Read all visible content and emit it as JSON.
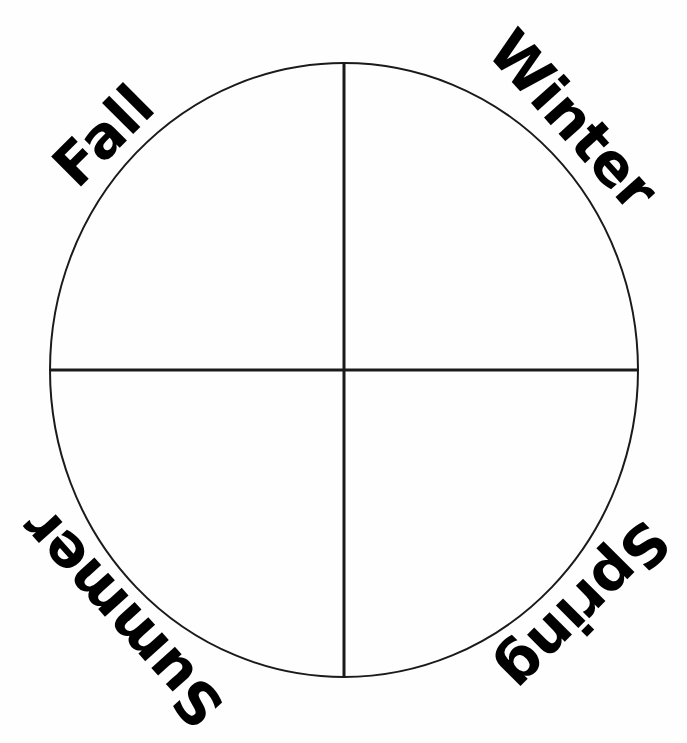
{
  "diagram": {
    "type": "seasons-wheel",
    "background_color": "#fefefe",
    "line_color": "#1a1a1a",
    "text_color": "#000000",
    "circle": {
      "center_x": 344,
      "center_y": 370,
      "radius_x": 294,
      "radius_y": 307,
      "stroke_width": 2
    },
    "dividers": [
      {
        "name": "vertical-diameter",
        "orientation": "vertical",
        "stroke_width": 3
      },
      {
        "name": "horizontal-diameter",
        "orientation": "horizontal",
        "stroke_width": 3
      }
    ],
    "labels": [
      {
        "id": "fall",
        "text": "Fall",
        "quadrant": "upper-left",
        "rotation_deg": -45
      },
      {
        "id": "winter",
        "text": "Winter",
        "quadrant": "upper-right",
        "rotation_deg": 48
      },
      {
        "id": "spring",
        "text": "Spring",
        "quadrant": "lower-right",
        "rotation_deg": 135
      },
      {
        "id": "summer",
        "text": "Summer",
        "quadrant": "lower-left",
        "rotation_deg": 228
      }
    ]
  }
}
